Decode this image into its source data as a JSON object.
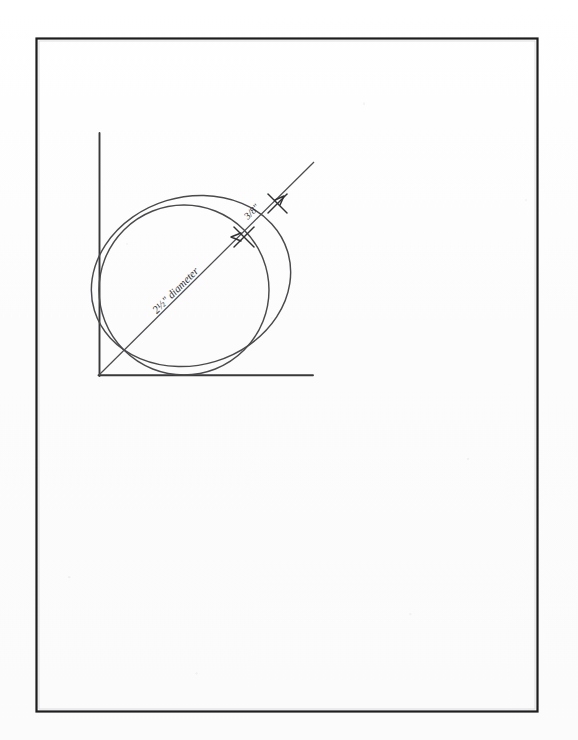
{
  "page": {
    "background_color": "#fdfdfd",
    "border_color": "#1d1d1d",
    "ink_color": "#3a3a3c",
    "frame": {
      "x": 36,
      "y": 38,
      "width": 502,
      "height": 674
    }
  },
  "figure": {
    "axes": {
      "line_color": "#39393b",
      "origin": {
        "x": 99,
        "y": 375
      },
      "vertical_axis": {
        "x1": 99,
        "y1": 133,
        "x2": 99,
        "y2": 375
      },
      "horizontal_axis": {
        "x1": 99,
        "y1": 375,
        "x2": 313,
        "y2": 375
      }
    },
    "dimension_line": {
      "name": "diameter-dimension-line",
      "from": {
        "x": 99,
        "y": 375
      },
      "to": {
        "x": 313,
        "y": 163
      },
      "color": "#4a4a4c"
    },
    "circle": {
      "name": "inscribed-circle",
      "center": {
        "x": 183,
        "y": 290
      },
      "radius": 85,
      "tangent_to": "both axes"
    },
    "ellipse": {
      "name": "rotated-ellipse",
      "center": {
        "x": 191,
        "y": 280
      },
      "rx": 101,
      "ry": 84,
      "rotation_deg": -17
    },
    "markers": [
      {
        "name": "marker-inner-intersection",
        "x": 244,
        "y": 237
      },
      {
        "name": "marker-outer-intersection",
        "x": 277,
        "y": 203
      }
    ],
    "labels": {
      "diameter": {
        "text": "2½\" diameter",
        "x": 178,
        "y": 293,
        "rotation_deg": -45,
        "font_size": 10
      },
      "offset": {
        "text": "3/8\"",
        "x": 254,
        "y": 214,
        "rotation_deg": -45,
        "font_size": 9
      }
    }
  }
}
